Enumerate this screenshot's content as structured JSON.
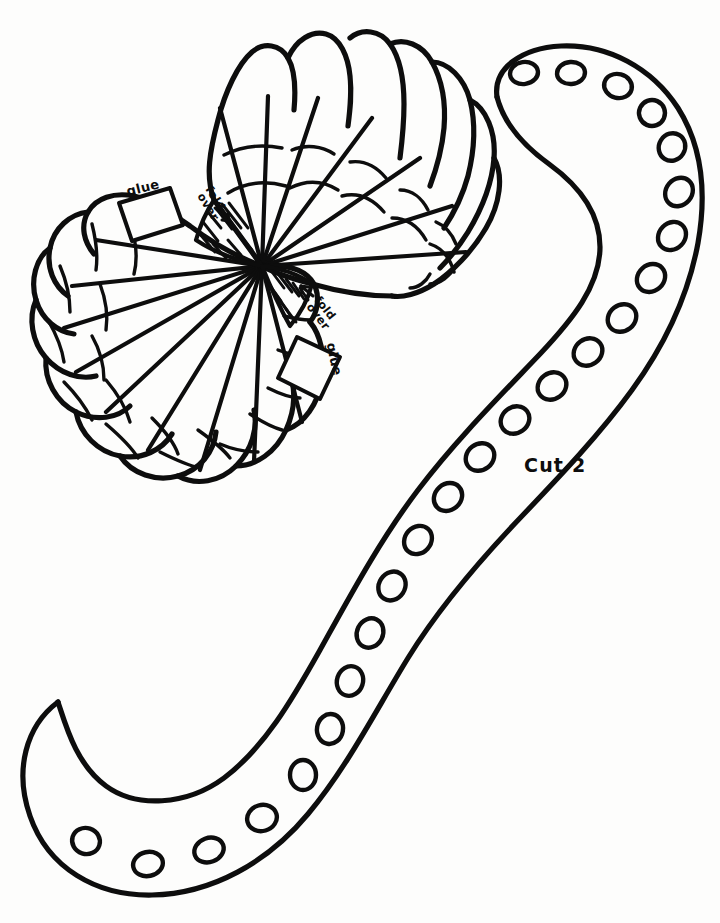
{
  "document": {
    "kind": "line-art-craft-template",
    "title": "Octopus tentacle and fan shell cut-and-glue template",
    "background_color": "#fdfdfc",
    "ink_color": "#0d0d0d",
    "width": 720,
    "height": 923
  },
  "annotations": {
    "glue_top": "glue",
    "glue_bottom": "glue",
    "fold_over_top_line1": "fold",
    "fold_over_top_line2": "over",
    "fold_over_bottom_line1": "fold",
    "fold_over_bottom_line2": "over",
    "cut_count": "Cut 2",
    "arrow_top_glyph": "→",
    "arrow_bottom_glyph": "←"
  },
  "shell": {
    "name": "fan-shell-piece",
    "lobe_count_upper": 7,
    "lobe_count_lower": 8,
    "hub": {
      "x": 262,
      "y": 266
    },
    "hatched_regions": 2,
    "hatch_lines_upper": 9,
    "hatch_lines_lower": 9
  },
  "tentacle": {
    "name": "tentacle-piece",
    "sucker_count": 24,
    "suckers": [
      {
        "cx": 524,
        "cy": 73,
        "rx": 14,
        "ry": 11,
        "rot": -8
      },
      {
        "cx": 571,
        "cy": 73,
        "rx": 14,
        "ry": 11,
        "rot": -4
      },
      {
        "cx": 618,
        "cy": 86,
        "rx": 14,
        "ry": 12,
        "rot": 14
      },
      {
        "cx": 652,
        "cy": 113,
        "rx": 13,
        "ry": 13,
        "rot": 24
      },
      {
        "cx": 672,
        "cy": 147,
        "rx": 13,
        "ry": 14,
        "rot": 32
      },
      {
        "cx": 679,
        "cy": 192,
        "rx": 13,
        "ry": 15,
        "rot": 40
      },
      {
        "cx": 672,
        "cy": 236,
        "rx": 13,
        "ry": 15,
        "rot": 44
      },
      {
        "cx": 651,
        "cy": 278,
        "rx": 13,
        "ry": 15,
        "rot": 48
      },
      {
        "cx": 622,
        "cy": 318,
        "rx": 13,
        "ry": 15,
        "rot": 52
      },
      {
        "cx": 588,
        "cy": 352,
        "rx": 13,
        "ry": 15,
        "rot": 54
      },
      {
        "cx": 552,
        "cy": 386,
        "rx": 13,
        "ry": 15,
        "rot": 54
      },
      {
        "cx": 515,
        "cy": 420,
        "rx": 13,
        "ry": 15,
        "rot": 54
      },
      {
        "cx": 480,
        "cy": 457,
        "rx": 13,
        "ry": 15,
        "rot": 52
      },
      {
        "cx": 448,
        "cy": 497,
        "rx": 13,
        "ry": 15,
        "rot": 48
      },
      {
        "cx": 418,
        "cy": 540,
        "rx": 13,
        "ry": 15,
        "rot": 42
      },
      {
        "cx": 392,
        "cy": 586,
        "rx": 13,
        "ry": 15,
        "rot": 34
      },
      {
        "cx": 370,
        "cy": 633,
        "rx": 13,
        "ry": 15,
        "rot": 26
      },
      {
        "cx": 350,
        "cy": 681,
        "rx": 13,
        "ry": 15,
        "rot": 18
      },
      {
        "cx": 330,
        "cy": 729,
        "rx": 13,
        "ry": 15,
        "rot": 10
      },
      {
        "cx": 303,
        "cy": 775,
        "rx": 13,
        "ry": 15,
        "rot": 0
      },
      {
        "cx": 262,
        "cy": 818,
        "rx": 15,
        "ry": 13,
        "rot": -16
      },
      {
        "cx": 209,
        "cy": 850,
        "rx": 15,
        "ry": 12,
        "rot": -20
      },
      {
        "cx": 148,
        "cy": 864,
        "rx": 15,
        "ry": 12,
        "rot": -12
      },
      {
        "cx": 86,
        "cy": 841,
        "rx": 14,
        "ry": 13,
        "rot": 18
      }
    ]
  }
}
